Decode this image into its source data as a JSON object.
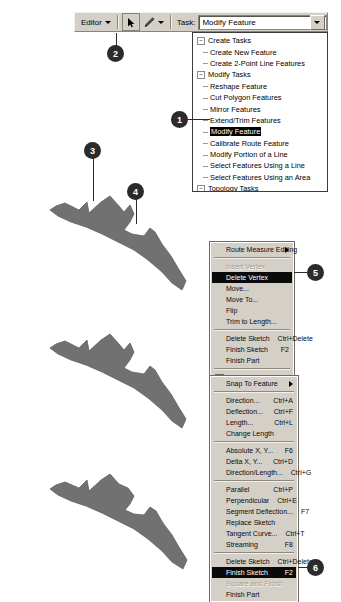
{
  "toolbar": {
    "editor_label": "Editor",
    "arrow_tool_name": "select-arrow",
    "pencil_tool_name": "sketch-pencil",
    "task_label": "Task:",
    "task_value": "Modify Feature"
  },
  "task_list": {
    "groups": [
      {
        "label": "Create Tasks",
        "items": [
          "Create New Feature",
          "Create 2-Point Line Features"
        ]
      },
      {
        "label": "Modify Tasks",
        "items": [
          "Reshape Feature",
          "Cut Polygon Features",
          "Mirror Features",
          "Extend/Trim Features",
          "Modify Feature",
          "Calibrate Route Feature",
          "Modify Portion of a Line",
          "Select Features Using a Line",
          "Select Features Using an Area"
        ],
        "selected": "Modify Feature"
      },
      {
        "label": "Topology Tasks",
        "items": [
          "Modify Edge",
          "Reshape Edge",
          "Auto Complete Polygons"
        ]
      }
    ]
  },
  "context_menu_measure": {
    "items": [
      {
        "label": "Route Measure Editing",
        "accel": "",
        "submenu": true,
        "disabled": false,
        "highlight": false,
        "checkbox": false
      },
      {
        "sep": true
      },
      {
        "label": "Insert Vertex",
        "accel": "",
        "submenu": false,
        "disabled": true,
        "highlight": false,
        "checkbox": false
      },
      {
        "label": "Delete Vertex",
        "accel": "",
        "submenu": false,
        "disabled": false,
        "highlight": true,
        "checkbox": false
      },
      {
        "label": "Move...",
        "accel": "",
        "submenu": false,
        "disabled": false,
        "highlight": false,
        "checkbox": false
      },
      {
        "label": "Move To...",
        "accel": "",
        "submenu": false,
        "disabled": false,
        "highlight": false,
        "checkbox": false
      },
      {
        "label": "Flip",
        "accel": "",
        "submenu": false,
        "disabled": false,
        "highlight": false,
        "checkbox": false
      },
      {
        "label": "Trim to Length...",
        "accel": "",
        "submenu": false,
        "disabled": false,
        "highlight": false,
        "checkbox": false
      },
      {
        "sep": true
      },
      {
        "label": "Delete Sketch",
        "accel": "Ctrl+Delete",
        "submenu": false,
        "disabled": false,
        "highlight": false,
        "checkbox": false
      },
      {
        "label": "Finish Sketch",
        "accel": "F2",
        "submenu": false,
        "disabled": false,
        "highlight": false,
        "checkbox": false
      },
      {
        "label": "Finish Part",
        "accel": "",
        "submenu": false,
        "disabled": false,
        "highlight": false,
        "checkbox": false
      },
      {
        "sep": true
      },
      {
        "label": "Properties...",
        "accel": "",
        "submenu": false,
        "disabled": false,
        "highlight": false,
        "checkbox": true
      }
    ]
  },
  "context_menu_sketch": {
    "items": [
      {
        "label": "Snap To Feature",
        "accel": "",
        "submenu": true,
        "disabled": false,
        "highlight": false,
        "checkbox": false
      },
      {
        "sep": true
      },
      {
        "label": "Direction...",
        "accel": "Ctrl+A",
        "submenu": false,
        "disabled": false,
        "highlight": false,
        "checkbox": false
      },
      {
        "label": "Deflection...",
        "accel": "Ctrl+F",
        "submenu": false,
        "disabled": false,
        "highlight": false,
        "checkbox": false
      },
      {
        "label": "Length...",
        "accel": "Ctrl+L",
        "submenu": false,
        "disabled": false,
        "highlight": false,
        "checkbox": false
      },
      {
        "label": "Change Length",
        "accel": "",
        "submenu": false,
        "disabled": false,
        "highlight": false,
        "checkbox": false
      },
      {
        "sep": true
      },
      {
        "label": "Absolute X, Y...",
        "accel": "F6",
        "submenu": false,
        "disabled": false,
        "highlight": false,
        "checkbox": false
      },
      {
        "label": "Delta X, Y...",
        "accel": "Ctrl+D",
        "submenu": false,
        "disabled": false,
        "highlight": false,
        "checkbox": false
      },
      {
        "label": "Direction/Length...",
        "accel": "Ctrl+G",
        "submenu": false,
        "disabled": false,
        "highlight": false,
        "checkbox": false
      },
      {
        "sep": true
      },
      {
        "label": "Parallel",
        "accel": "Ctrl+P",
        "submenu": false,
        "disabled": false,
        "highlight": false,
        "checkbox": false
      },
      {
        "label": "Perpendicular",
        "accel": "Ctrl+E",
        "submenu": false,
        "disabled": false,
        "highlight": false,
        "checkbox": false
      },
      {
        "label": "Segment Deflection...",
        "accel": "F7",
        "submenu": false,
        "disabled": false,
        "highlight": false,
        "checkbox": false
      },
      {
        "label": "Replace Sketch",
        "accel": "",
        "submenu": false,
        "disabled": false,
        "highlight": false,
        "checkbox": false
      },
      {
        "label": "Tangent Curve...",
        "accel": "Ctrl+T",
        "submenu": false,
        "disabled": false,
        "highlight": false,
        "checkbox": false
      },
      {
        "label": "Streaming",
        "accel": "F8",
        "submenu": false,
        "disabled": false,
        "highlight": false,
        "checkbox": false
      },
      {
        "sep": true
      },
      {
        "label": "Delete Sketch",
        "accel": "Ctrl+Delete",
        "submenu": false,
        "disabled": false,
        "highlight": false,
        "checkbox": false
      },
      {
        "label": "Finish Sketch",
        "accel": "F2",
        "submenu": false,
        "disabled": false,
        "highlight": true,
        "checkbox": false
      },
      {
        "label": "Square and Finish",
        "accel": "",
        "submenu": false,
        "disabled": true,
        "highlight": false,
        "checkbox": false
      },
      {
        "label": "Finish Part",
        "accel": "",
        "submenu": false,
        "disabled": false,
        "highlight": false,
        "checkbox": false
      }
    ]
  },
  "callouts": [
    {
      "number": "1"
    },
    {
      "number": "2"
    },
    {
      "number": "3"
    },
    {
      "number": "4"
    },
    {
      "number": "5"
    },
    {
      "number": "6"
    }
  ],
  "shapes": {
    "fill_color": "#717171",
    "edge_color": "#5f5f5f",
    "count": 3
  }
}
